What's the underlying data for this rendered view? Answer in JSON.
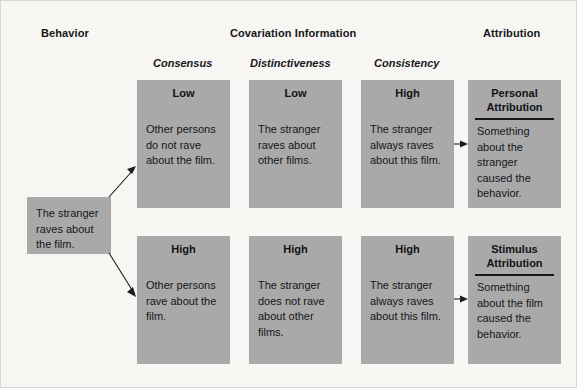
{
  "headers": {
    "behavior": "Behavior",
    "covariation": "Covariation Information",
    "attribution": "Attribution"
  },
  "subheaders": {
    "consensus": "Consensus",
    "distinctiveness": "Distinctiveness",
    "consistency": "Consistency"
  },
  "behavior_box": {
    "text": "The stranger raves about the film."
  },
  "rows": [
    {
      "consensus": {
        "title": "Low",
        "body": "Other persons do not rave about the film."
      },
      "distinctiveness": {
        "title": "Low",
        "body": "The stranger raves about other films."
      },
      "consistency": {
        "title": "High",
        "body": "The stranger always raves about this film."
      },
      "attribution": {
        "title": "Personal Attribution",
        "body": "Something about the stranger caused the behavior."
      }
    },
    {
      "consensus": {
        "title": "High",
        "body": "Other persons rave about the film."
      },
      "distinctiveness": {
        "title": "High",
        "body": "The stranger does not rave about other films."
      },
      "consistency": {
        "title": "High",
        "body": "The stranger always raves about this film."
      },
      "attribution": {
        "title": "Stimulus Attribution",
        "body": "Something about the film caused the behavior."
      }
    }
  ],
  "colors": {
    "cell_fill": "#a9a9a9",
    "background": "#f7f6f3",
    "text": "#15161a",
    "rule": "#16171b"
  }
}
